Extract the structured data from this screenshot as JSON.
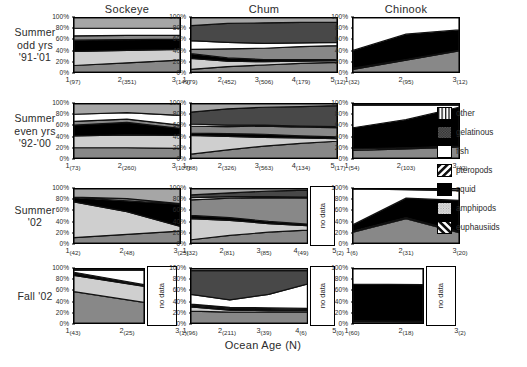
{
  "figure": {
    "xaxis_title": "Ocean Age (N)",
    "y_ticks": [
      "100%",
      "80%",
      "60%",
      "40%",
      "20%",
      "0%"
    ],
    "no_data_label": "no data",
    "columns": [
      {
        "key": "sockeye",
        "title": "Sockeye"
      },
      {
        "key": "chum",
        "title": "Chum"
      },
      {
        "key": "chinook",
        "title": "Chinook"
      }
    ],
    "rows": [
      {
        "key": "summer_odd",
        "label_lines": [
          "Summer",
          "odd yrs",
          "'91-'01"
        ]
      },
      {
        "key": "summer_even",
        "label_lines": [
          "Summer",
          "even yrs",
          "'92-'00"
        ]
      },
      {
        "key": "summer_02",
        "label_lines": [
          "Summer",
          "'02"
        ]
      },
      {
        "key": "fall_02",
        "label_lines": [
          "Fall '02"
        ]
      }
    ]
  },
  "legend": {
    "position": "right",
    "items": [
      {
        "label": "other",
        "pattern": "vertical-stripes",
        "color": "#ffffff"
      },
      {
        "label": "gelatinous",
        "pattern": "dark-checker",
        "color": "#6b6b6b"
      },
      {
        "label": "fish",
        "pattern": "solid-white",
        "color": "#ffffff"
      },
      {
        "label": "pteropods",
        "pattern": "forward-hatch",
        "color": "#ffffff"
      },
      {
        "label": "squid",
        "pattern": "solid-black",
        "color": "#000000"
      },
      {
        "label": "amphipods",
        "pattern": "light-dots",
        "color": "#d9d9d9"
      },
      {
        "label": "euphausiids",
        "pattern": "back-hatch",
        "color": "#ffffff"
      }
    ]
  },
  "chart_data": {
    "type": "area",
    "xlabel": "Ocean Age (N)",
    "ylabel": "Percent composition",
    "ylim": [
      0,
      100
    ],
    "grid": false,
    "stacking": "percent",
    "legend_position": "right",
    "series_order": [
      "euphausiids",
      "amphipods",
      "squid",
      "pteropods",
      "fish",
      "gelatinous",
      "other"
    ],
    "panels": [
      {
        "row": "Summer odd yrs '91-'01",
        "column": "Sockeye",
        "x": [
          1,
          2,
          3
        ],
        "x_tick_labels": [
          "1",
          "2",
          "3"
        ],
        "sample_sizes": [
          97,
          351,
          149
        ],
        "series": [
          {
            "name": "euphausiids",
            "values": [
              12,
              17,
              22
            ]
          },
          {
            "name": "amphipods",
            "values": [
              26,
              23,
              20
            ]
          },
          {
            "name": "squid",
            "values": [
              21,
              20,
              19
            ]
          },
          {
            "name": "pteropods",
            "values": [
              8,
              8,
              7
            ]
          },
          {
            "name": "fish",
            "values": [
              14,
              13,
              13
            ]
          },
          {
            "name": "gelatinous",
            "values": [
              0,
              0,
              0
            ]
          },
          {
            "name": "other",
            "values": [
              19,
              19,
              19
            ]
          }
        ]
      },
      {
        "row": "Summer odd yrs '91-'01",
        "column": "Chum",
        "x": [
          1,
          2,
          3,
          4,
          5
        ],
        "x_tick_labels": [
          "1",
          "2",
          "3",
          "4",
          "5"
        ],
        "sample_sizes": [
          79,
          452,
          506,
          179,
          12
        ],
        "series": [
          {
            "name": "euphausiids",
            "values": [
              5,
              10,
              13,
              16,
              18
            ]
          },
          {
            "name": "amphipods",
            "values": [
              20,
              10,
              6,
              4,
              3
            ]
          },
          {
            "name": "squid",
            "values": [
              9,
              6,
              4,
              3,
              2
            ]
          },
          {
            "name": "pteropods",
            "values": [
              8,
              17,
              21,
              24,
              26
            ]
          },
          {
            "name": "fish",
            "values": [
              16,
              12,
              9,
              7,
              6
            ]
          },
          {
            "name": "gelatinous",
            "values": [
              28,
              35,
              38,
              38,
              37
            ]
          },
          {
            "name": "other",
            "values": [
              14,
              10,
              9,
              8,
              8
            ]
          }
        ]
      },
      {
        "row": "Summer odd yrs '91-'01",
        "column": "Chinook",
        "x": [
          1,
          2,
          3
        ],
        "x_tick_labels": [
          "1",
          "2",
          "3"
        ],
        "sample_sizes": [
          32,
          95,
          12
        ],
        "series": [
          {
            "name": "euphausiids",
            "values": [
              5,
              22,
              39
            ]
          },
          {
            "name": "amphipods",
            "values": [
              2,
              1,
              1
            ]
          },
          {
            "name": "squid",
            "values": [
              33,
              47,
              38
            ]
          },
          {
            "name": "pteropods",
            "values": [
              0,
              0,
              0
            ]
          },
          {
            "name": "fish",
            "values": [
              60,
              30,
              22
            ]
          },
          {
            "name": "gelatinous",
            "values": [
              0,
              0,
              0
            ]
          },
          {
            "name": "other",
            "values": [
              0,
              0,
              0
            ]
          }
        ]
      },
      {
        "row": "Summer even yrs '92-'00",
        "column": "Sockeye",
        "x": [
          1,
          2,
          3
        ],
        "x_tick_labels": [
          "1",
          "2",
          "3"
        ],
        "sample_sizes": [
          73,
          260,
          107
        ],
        "series": [
          {
            "name": "euphausiids",
            "values": [
              19,
              19,
              18
            ]
          },
          {
            "name": "amphipods",
            "values": [
              22,
              24,
              24
            ]
          },
          {
            "name": "squid",
            "values": [
              20,
              23,
              13
            ]
          },
          {
            "name": "pteropods",
            "values": [
              7,
              6,
              6
            ]
          },
          {
            "name": "fish",
            "values": [
              13,
              12,
              18
            ]
          },
          {
            "name": "gelatinous",
            "values": [
              0,
              0,
              0
            ]
          },
          {
            "name": "other",
            "values": [
              19,
              16,
              21
            ]
          }
        ]
      },
      {
        "row": "Summer even yrs '92-'00",
        "column": "Chum",
        "x": [
          1,
          2,
          3,
          4,
          5
        ],
        "x_tick_labels": [
          "1",
          "2",
          "3",
          "4",
          "5"
        ],
        "sample_sizes": [
          88,
          326,
          563,
          134,
          17
        ],
        "series": [
          {
            "name": "euphausiids",
            "values": [
              7,
              15,
              22,
              27,
              31
            ]
          },
          {
            "name": "amphipods",
            "values": [
              35,
              25,
              16,
              10,
              5
            ]
          },
          {
            "name": "squid",
            "values": [
              4,
              5,
              6,
              4,
              3
            ]
          },
          {
            "name": "pteropods",
            "values": [
              13,
              13,
              15,
              16,
              17
            ]
          },
          {
            "name": "fish",
            "values": [
              4,
              3,
              2,
              2,
              2
            ]
          },
          {
            "name": "gelatinous",
            "values": [
              22,
              30,
              33,
              36,
              39
            ]
          },
          {
            "name": "other",
            "values": [
              15,
              9,
              6,
              5,
              3
            ]
          }
        ]
      },
      {
        "row": "Summer even yrs '92-'00",
        "column": "Chinook",
        "x": [
          1,
          2,
          3
        ],
        "x_tick_labels": [
          "1",
          "2",
          "3"
        ],
        "sample_sizes": [
          54,
          103,
          42
        ],
        "series": [
          {
            "name": "euphausiids",
            "values": [
              14,
              17,
              20
            ]
          },
          {
            "name": "amphipods",
            "values": [
              3,
              2,
              2
            ]
          },
          {
            "name": "squid",
            "values": [
              39,
              52,
              72
            ]
          },
          {
            "name": "pteropods",
            "values": [
              0,
              0,
              0
            ]
          },
          {
            "name": "fish",
            "values": [
              42,
              27,
              4
            ]
          },
          {
            "name": "gelatinous",
            "values": [
              0,
              0,
              0
            ]
          },
          {
            "name": "other",
            "values": [
              2,
              2,
              2
            ]
          }
        ]
      },
      {
        "row": "Summer '02",
        "column": "Sockeye",
        "x": [
          1,
          2,
          3
        ],
        "x_tick_labels": [
          "1",
          "2",
          "3"
        ],
        "sample_sizes": [
          42,
          48,
          25
        ],
        "series": [
          {
            "name": "euphausiids",
            "values": [
              10,
              16,
              22
            ]
          },
          {
            "name": "amphipods",
            "values": [
              66,
              42,
              9
            ]
          },
          {
            "name": "squid",
            "values": [
              8,
              20,
              41
            ]
          },
          {
            "name": "pteropods",
            "values": [
              1,
              4,
              1
            ]
          },
          {
            "name": "fish",
            "values": [
              0,
              0,
              0
            ]
          },
          {
            "name": "gelatinous",
            "values": [
              0,
              0,
              0
            ]
          },
          {
            "name": "other",
            "values": [
              15,
              18,
              27
            ]
          }
        ]
      },
      {
        "row": "Summer '02",
        "column": "Chum",
        "x": [
          1,
          2,
          3,
          4,
          5
        ],
        "x_tick_labels": [
          "1",
          "2",
          "3",
          "4",
          "5"
        ],
        "sample_sizes": [
          32,
          81,
          85,
          49,
          2
        ],
        "series": [
          {
            "name": "euphausiids",
            "values": [
              6,
              14,
              20,
              24,
              26
            ]
          },
          {
            "name": "amphipods",
            "values": [
              39,
              28,
              16,
              8,
              6
            ]
          },
          {
            "name": "squid",
            "values": [
              6,
              5,
              4,
              3,
              3
            ]
          },
          {
            "name": "pteropods",
            "values": [
              29,
              36,
              44,
              48,
              48
            ]
          },
          {
            "name": "fish",
            "values": [
              4,
              3,
              2,
              2,
              2
            ]
          },
          {
            "name": "gelatinous",
            "values": [
              5,
              7,
              10,
              13,
              13
            ]
          },
          {
            "name": "other",
            "values": [
              11,
              7,
              4,
              2,
              2
            ]
          }
        ],
        "no_data_at": 5
      },
      {
        "row": "Summer '02",
        "column": "Chinook",
        "x": [
          1,
          2,
          3
        ],
        "x_tick_labels": [
          "1",
          "2",
          "3"
        ],
        "sample_sizes": [
          6,
          31,
          20
        ],
        "series": [
          {
            "name": "euphausiids",
            "values": [
              20,
              45,
              19
            ]
          },
          {
            "name": "amphipods",
            "values": [
              2,
              2,
              2
            ]
          },
          {
            "name": "squid",
            "values": [
              12,
              36,
              58
            ]
          },
          {
            "name": "pteropods",
            "values": [
              0,
              0,
              0
            ]
          },
          {
            "name": "fish",
            "values": [
              66,
              16,
              18
            ]
          },
          {
            "name": "gelatinous",
            "values": [
              0,
              0,
              0
            ]
          },
          {
            "name": "other",
            "values": [
              0,
              1,
              3
            ]
          }
        ]
      },
      {
        "row": "Fall '02",
        "column": "Sockeye",
        "x": [
          1,
          2,
          3
        ],
        "x_tick_labels": [
          "1",
          "2",
          "3"
        ],
        "sample_sizes": [
          43,
          25,
          1
        ],
        "series": [
          {
            "name": "euphausiids",
            "values": [
              58,
              38,
              30
            ]
          },
          {
            "name": "amphipods",
            "values": [
              30,
              30,
              35
            ]
          },
          {
            "name": "squid",
            "values": [
              4,
              2,
              2
            ]
          },
          {
            "name": "pteropods",
            "values": [
              2,
              1,
              1
            ]
          },
          {
            "name": "fish",
            "values": [
              4,
              27,
              30
            ]
          },
          {
            "name": "gelatinous",
            "values": [
              0,
              0,
              0
            ]
          },
          {
            "name": "other",
            "values": [
              2,
              2,
              2
            ]
          }
        ],
        "no_data_at": 3
      },
      {
        "row": "Fall '02",
        "column": "Chum",
        "x": [
          1,
          2,
          3,
          4,
          5
        ],
        "x_tick_labels": [
          "1",
          "2",
          "3",
          "4",
          "5"
        ],
        "sample_sizes": [
          96,
          211,
          39,
          6,
          0
        ],
        "series": [
          {
            "name": "euphausiids",
            "values": [
              22,
              20,
              20,
              20,
              20
            ]
          },
          {
            "name": "amphipods",
            "values": [
              8,
              4,
              3,
              3,
              3
            ]
          },
          {
            "name": "squid",
            "values": [
              3,
              3,
              3,
              2,
              2
            ]
          },
          {
            "name": "pteropods",
            "values": [
              2,
              2,
              2,
              2,
              2
            ]
          },
          {
            "name": "fish",
            "values": [
              18,
              14,
              25,
              45,
              50
            ]
          },
          {
            "name": "gelatinous",
            "values": [
              44,
              54,
              44,
              25,
              20
            ]
          },
          {
            "name": "other",
            "values": [
              3,
              3,
              3,
              3,
              3
            ]
          }
        ],
        "no_data_at": 5
      },
      {
        "row": "Fall '02",
        "column": "Chinook",
        "x": [
          1,
          2,
          3
        ],
        "x_tick_labels": [
          "1",
          "2",
          "3"
        ],
        "sample_sizes": [
          60,
          18,
          2
        ],
        "series": [
          {
            "name": "euphausiids",
            "values": [
              3,
              2,
              2
            ]
          },
          {
            "name": "amphipods",
            "values": [
              1,
              1,
              1
            ]
          },
          {
            "name": "squid",
            "values": [
              68,
              68,
              68
            ]
          },
          {
            "name": "pteropods",
            "values": [
              0,
              0,
              0
            ]
          },
          {
            "name": "fish",
            "values": [
              28,
              29,
              29
            ]
          },
          {
            "name": "gelatinous",
            "values": [
              0,
              0,
              0
            ]
          },
          {
            "name": "other",
            "values": [
              0,
              0,
              0
            ]
          }
        ],
        "no_data_at": 3
      }
    ]
  }
}
